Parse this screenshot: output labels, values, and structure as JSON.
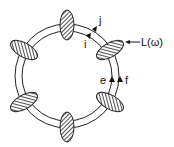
{
  "diagram": {
    "type": "ring-resonator-with-scatterers",
    "labels": {
      "j": "j",
      "i": "i",
      "e": "e",
      "f": "f",
      "L": "L(ω)"
    },
    "ring": {
      "center": [
        67,
        76
      ],
      "outer_radius": 52,
      "inner_radius": 45
    },
    "elements": [
      {
        "name": "top",
        "cx": 67,
        "cy": 25,
        "rx": 7,
        "ry": 15,
        "rot": 0
      },
      {
        "name": "upper-right",
        "cx": 110,
        "cy": 50,
        "rx": 7,
        "ry": 15,
        "rot": 60
      },
      {
        "name": "lower-right",
        "cx": 110,
        "cy": 102,
        "rx": 7,
        "ry": 15,
        "rot": -60
      },
      {
        "name": "bottom",
        "cx": 67,
        "cy": 127,
        "rx": 7,
        "ry": 15,
        "rot": 0
      },
      {
        "name": "lower-left",
        "cx": 24,
        "cy": 102,
        "rx": 7,
        "ry": 15,
        "rot": 60
      },
      {
        "name": "upper-left",
        "cx": 24,
        "cy": 50,
        "rx": 7,
        "ry": 15,
        "rot": -60
      }
    ],
    "colors": {
      "stroke": "#222222",
      "fill": "#555555"
    }
  }
}
